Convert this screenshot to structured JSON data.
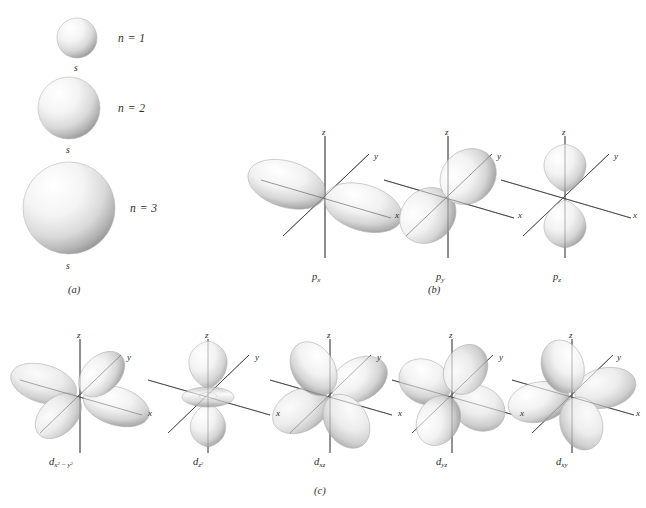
{
  "figure": {
    "background": "#ffffff",
    "ink": "#2b2b2b",
    "lobe_fill_light": "#ffffff",
    "lobe_fill_mid": "#d8d8d8",
    "lobe_fill_dark": "#8e8e8e",
    "axis_color": "#4a4a4a"
  },
  "panels": [
    {
      "id": "a",
      "label": "(a)",
      "x": 68,
      "y": 290,
      "caption_of": "s orbitals"
    },
    {
      "id": "b",
      "label": "(b)",
      "x": 432,
      "y": 290,
      "caption_of": "p orbitals"
    },
    {
      "id": "c",
      "label": "(c)",
      "x": 320,
      "y": 492,
      "caption_of": "d orbitals"
    }
  ],
  "s_orbitals": [
    {
      "name": "1s",
      "n_label": "n = 1",
      "orbital_label": "s",
      "cx": 77,
      "cy": 38,
      "r": 20,
      "n_x": 118,
      "n_y": 33,
      "s_x": 74,
      "s_y": 64
    },
    {
      "name": "2s",
      "n_label": "n = 2",
      "orbital_label": "s",
      "cx": 69,
      "cy": 108,
      "r": 31,
      "n_x": 118,
      "n_y": 103,
      "s_x": 66,
      "s_y": 146
    },
    {
      "name": "3s",
      "n_label": "n = 3",
      "orbital_label": "s",
      "cx": 69,
      "cy": 208,
      "r": 46,
      "n_x": 130,
      "n_y": 203,
      "s_x": 66,
      "s_y": 262
    }
  ],
  "axis_labels": {
    "z": "z",
    "y": "y",
    "x": "x"
  },
  "p_orbitals": [
    {
      "name": "px",
      "label_main": "p",
      "label_sub": "x",
      "cx": 325,
      "cy": 196,
      "label_x": 312,
      "label_y": 276,
      "orientation": "x-axis horizontal lobes"
    },
    {
      "name": "py",
      "label_main": "p",
      "label_sub": "y",
      "cx": 448,
      "cy": 196,
      "label_x": 436,
      "label_y": 276,
      "orientation": "y-axis diagonal lobes"
    },
    {
      "name": "pz",
      "label_main": "p",
      "label_sub": "z",
      "cx": 565,
      "cy": 196,
      "label_x": 553,
      "label_y": 276,
      "orientation": "z-axis vertical lobes"
    }
  ],
  "d_orbitals": [
    {
      "name": "dx2-y2",
      "label_main": "d",
      "label_sub_html": "x2 - y2",
      "sub_x": "x",
      "sup1": "2",
      "minus": " − ",
      "sub_y": "y",
      "sup2": "2",
      "cx": 80,
      "cy": 395,
      "label_x": 49,
      "label_y": 462
    },
    {
      "name": "dz2",
      "label_main": "d",
      "label_sub_html": "z2",
      "sub_x": "z",
      "sup1": "2",
      "minus": "",
      "sub_y": "",
      "sup2": "",
      "cx": 208,
      "cy": 395,
      "label_x": 193,
      "label_y": 462
    },
    {
      "name": "dxz",
      "label_main": "d",
      "label_sub_html": "xz",
      "sub_x": "xz",
      "sup1": "",
      "minus": "",
      "sub_y": "",
      "sup2": "",
      "cx": 330,
      "cy": 395,
      "label_x": 314,
      "label_y": 462
    },
    {
      "name": "dyz",
      "label_main": "d",
      "label_sub_html": "yz",
      "sub_x": "yz",
      "sup1": "",
      "minus": "",
      "sub_y": "",
      "sup2": "",
      "cx": 452,
      "cy": 395,
      "label_x": 436,
      "label_y": 462
    },
    {
      "name": "dxy",
      "label_main": "d",
      "label_sub_html": "xy",
      "sub_x": "xy",
      "sup1": "",
      "minus": "",
      "sub_y": "",
      "sup2": "",
      "cx": 572,
      "cy": 395,
      "label_x": 556,
      "label_y": 462
    }
  ]
}
